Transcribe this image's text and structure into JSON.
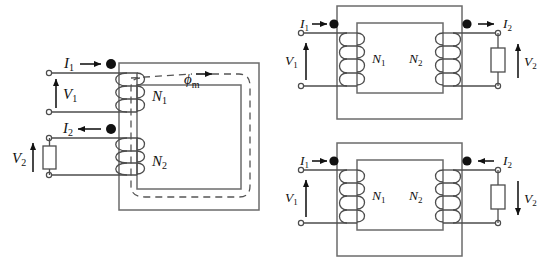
{
  "figure": {
    "type": "circuit-schematic",
    "background_color": "#ffffff",
    "line_color": "#4d4d4d",
    "core_color": "#6b6b6b",
    "dot_color": "#111111"
  },
  "diagrams": [
    {
      "id": "core-type-transformer",
      "position": "left",
      "description": "Core-type transformer with both windings on the left limb and mutual flux path shown dashed",
      "labels": {
        "primary_current": "I",
        "primary_current_sub": "1",
        "secondary_current": "I",
        "secondary_current_sub": "2",
        "primary_voltage": "V",
        "primary_voltage_sub": "1",
        "secondary_voltage": "V",
        "secondary_voltage_sub": "2",
        "primary_turns": "N",
        "primary_turns_sub": "1",
        "secondary_turns": "N",
        "secondary_turns_sub": "2",
        "flux": "ϕ",
        "flux_sub": "m"
      },
      "current_directions": {
        "I1": "right-into-dot",
        "I2": "left-into-dot"
      },
      "voltage_polarities": {
        "V1": "up",
        "V2": "up"
      },
      "dots": [
        "primary-top",
        "secondary-top"
      ],
      "flux_direction": "clockwise",
      "has_load_resistor": true
    },
    {
      "id": "shell-transformer-additive",
      "position": "top-right",
      "description": "Two-limb transformer, secondary current leaving the dotted terminal",
      "labels": {
        "primary_current": "I",
        "primary_current_sub": "1",
        "secondary_current": "I",
        "secondary_current_sub": "2",
        "primary_voltage": "V",
        "primary_voltage_sub": "1",
        "secondary_voltage": "V",
        "secondary_voltage_sub": "2",
        "primary_turns": "N",
        "primary_turns_sub": "1",
        "secondary_turns": "N",
        "secondary_turns_sub": "2"
      },
      "current_directions": {
        "I1": "right-into-dot",
        "I2": "right-out-of-dot"
      },
      "voltage_polarities": {
        "V1": "up",
        "V2": "up"
      },
      "dots": [
        "primary-top-left",
        "secondary-top-right"
      ],
      "has_load_resistor": true
    },
    {
      "id": "shell-transformer-subtractive",
      "position": "bottom-right",
      "description": "Two-limb transformer, secondary current entering the dotted terminal",
      "labels": {
        "primary_current": "I",
        "primary_current_sub": "1",
        "secondary_current": "I",
        "secondary_current_sub": "2",
        "primary_voltage": "V",
        "primary_voltage_sub": "1",
        "secondary_voltage": "V",
        "secondary_voltage_sub": "2",
        "primary_turns": "N",
        "primary_turns_sub": "1",
        "secondary_turns": "N",
        "secondary_turns_sub": "2"
      },
      "current_directions": {
        "I1": "right-into-dot",
        "I2": "left-into-dot"
      },
      "voltage_polarities": {
        "V1": "up",
        "V2": "down"
      },
      "dots": [
        "primary-top-left",
        "secondary-top-right"
      ],
      "has_load_resistor": true
    }
  ]
}
